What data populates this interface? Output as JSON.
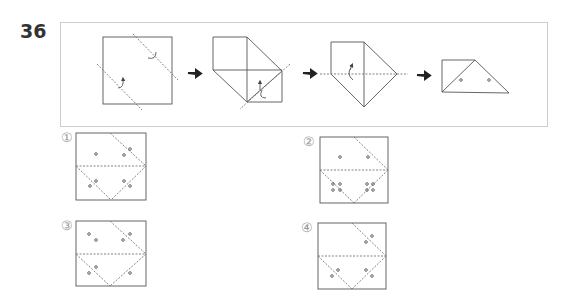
{
  "question": {
    "number": "36"
  },
  "sequence": {
    "steps": [
      "fold-step-1",
      "fold-step-2",
      "fold-step-3",
      "fold-step-4-punched"
    ],
    "arrow_count": 3,
    "holes_in_final": 2
  },
  "options": [
    {
      "label": "①",
      "holes": 6
    },
    {
      "label": "②",
      "holes": 10
    },
    {
      "label": "③",
      "holes": 8
    },
    {
      "label": "④",
      "holes": 6
    }
  ],
  "colors": {
    "line": "#555555",
    "frame": "#cccccc",
    "label": "#999999"
  }
}
